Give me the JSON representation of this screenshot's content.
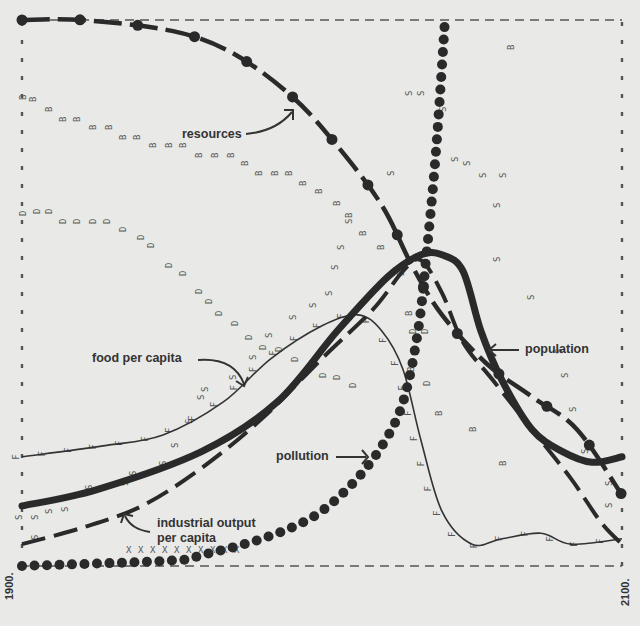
{
  "chart_data": {
    "type": "line",
    "title": "",
    "xlabel": "",
    "ylabel": "",
    "x_range": [
      1900,
      2100
    ],
    "x_tick_labels": [
      "1900.",
      "2100."
    ],
    "grid": false,
    "legend_position": "inline annotations",
    "annotations": [
      {
        "text": "resources",
        "series": "resources"
      },
      {
        "text": "food per capita",
        "series": "food_per_capita"
      },
      {
        "text": "population",
        "series": "population"
      },
      {
        "text": "pollution",
        "series": "pollution"
      },
      {
        "text": "industrial output per capita",
        "series": "industrial_output_per_capita"
      }
    ],
    "point_markers": [
      "B",
      "D",
      "S",
      "F",
      "R",
      "X"
    ],
    "series": [
      {
        "name": "resources",
        "style": "thick dashed with dots",
        "x": [
          1900,
          1920,
          1950,
          1970,
          1990,
          2005,
          2020,
          2030,
          2040,
          2055,
          2070,
          2085,
          2100
        ],
        "values": [
          1.0,
          1.0,
          0.98,
          0.94,
          0.86,
          0.77,
          0.66,
          0.55,
          0.46,
          0.37,
          0.31,
          0.25,
          0.13
        ]
      },
      {
        "name": "population",
        "style": "thick solid",
        "x": [
          1900,
          1925,
          1960,
          1985,
          2005,
          2022,
          2033,
          2040,
          2047,
          2053,
          2060,
          2070,
          2080,
          2090,
          2100
        ],
        "values": [
          0.11,
          0.14,
          0.21,
          0.3,
          0.43,
          0.53,
          0.57,
          0.57,
          0.54,
          0.43,
          0.34,
          0.25,
          0.21,
          0.19,
          0.2
        ]
      },
      {
        "name": "food_per_capita",
        "style": "thin solid with F marks",
        "x": [
          1900,
          1927,
          1947,
          1967,
          1983,
          2000,
          2012,
          2020,
          2027,
          2033,
          2040,
          2050,
          2060,
          2073,
          2083,
          2100
        ],
        "values": [
          0.2,
          0.22,
          0.24,
          0.3,
          0.38,
          0.44,
          0.46,
          0.43,
          0.36,
          0.23,
          0.1,
          0.04,
          0.05,
          0.06,
          0.04,
          0.05
        ]
      },
      {
        "name": "industrial_output_per_capita",
        "style": "long dashed",
        "x": [
          1900,
          1920,
          1940,
          1960,
          1980,
          2000,
          2017,
          2027,
          2033,
          2040,
          2047,
          2057,
          2070,
          2083,
          2093,
          2100
        ],
        "values": [
          0.04,
          0.07,
          0.11,
          0.18,
          0.27,
          0.38,
          0.47,
          0.54,
          0.56,
          0.5,
          0.41,
          0.34,
          0.25,
          0.16,
          0.08,
          0.04
        ]
      },
      {
        "name": "pollution",
        "style": "large dots",
        "x": [
          1900,
          1950,
          1960,
          1980,
          1997,
          2010,
          2020,
          2027,
          2032,
          2035,
          2038,
          2041
        ],
        "values": [
          0.0,
          0.01,
          0.02,
          0.05,
          0.09,
          0.15,
          0.22,
          0.3,
          0.43,
          0.58,
          0.76,
          1.0
        ]
      }
    ]
  }
}
